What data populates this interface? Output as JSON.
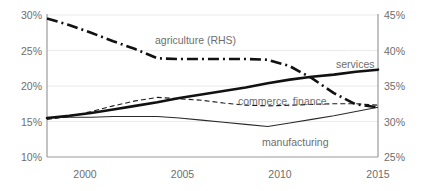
{
  "chart_data": {
    "type": "line",
    "title": "",
    "subtitle": "",
    "xlabel": "",
    "ylabel": "",
    "y2label": "",
    "grid": true,
    "legend_position": "inline-labels",
    "x": [
      2000,
      2001,
      2002,
      2003,
      2004,
      2005,
      2006,
      2007,
      2008,
      2009,
      2010,
      2011,
      2012,
      2013,
      2014,
      2015
    ],
    "xlim": [
      2000,
      2015
    ],
    "xticks": [
      "2000",
      "2005",
      "2010",
      "2015"
    ],
    "xtick_values": [
      2000,
      2005,
      2010,
      2015
    ],
    "ylim": [
      10,
      30
    ],
    "yticks": [
      "10%",
      "15%",
      "20%",
      "25%",
      "30%"
    ],
    "ytick_values": [
      10,
      15,
      20,
      25,
      30
    ],
    "y2lim": [
      25,
      45
    ],
    "y2ticks": [
      "25%",
      "30%",
      "35%",
      "40%",
      "45%"
    ],
    "y2tick_values": [
      25,
      30,
      35,
      40,
      45
    ],
    "series": [
      {
        "name": "services",
        "label": "services",
        "axis": "left",
        "style": "solid-thick",
        "color": "#111111",
        "values": [
          15.5,
          15.8,
          16.2,
          16.7,
          17.2,
          17.7,
          18.3,
          18.8,
          19.3,
          19.8,
          20.4,
          20.9,
          21.3,
          21.6,
          22.0,
          22.3
        ]
      },
      {
        "name": "commerce, finance",
        "label": "commerce, finance",
        "axis": "left",
        "style": "dashed-thin",
        "color": "#1a1a1a",
        "values": [
          15.3,
          15.7,
          16.4,
          17.2,
          17.9,
          18.4,
          18.2,
          18.0,
          17.6,
          17.3,
          17.2,
          17.3,
          17.4,
          17.5,
          17.5,
          17.3
        ]
      },
      {
        "name": "manufacturing",
        "label": "manufacturing",
        "axis": "left",
        "style": "solid-thin",
        "color": "#2a2a2a",
        "values": [
          15.5,
          15.6,
          15.6,
          15.7,
          15.7,
          15.7,
          15.5,
          15.2,
          14.9,
          14.6,
          14.3,
          14.8,
          15.3,
          15.8,
          16.4,
          17.0
        ]
      },
      {
        "name": "agriculture (RHS)",
        "label": "agriculture (RHS)",
        "axis": "right",
        "style": "dash-dot-thick",
        "color": "#111111",
        "values": [
          44.5,
          43.6,
          42.5,
          41.3,
          40.2,
          38.9,
          38.8,
          38.8,
          38.8,
          38.8,
          38.7,
          37.8,
          36.1,
          34.0,
          32.4,
          32.0
        ]
      }
    ],
    "annotations": [
      {
        "text": "agriculture (RHS)",
        "x": 2003.9,
        "y_axis": "right",
        "y": 41.2
      },
      {
        "text": "services",
        "x": 2013.6,
        "y_axis": "left",
        "y": 23.2
      },
      {
        "text": "commerce, finance",
        "x": 2010.4,
        "y_axis": "left",
        "y": 18.6
      },
      {
        "text": "manufacturing",
        "x": 2010.2,
        "y_axis": "left",
        "y": 13.1
      }
    ]
  },
  "axes": {
    "left": {
      "ticks": [
        {
          "label": "30%"
        },
        {
          "label": "25%"
        },
        {
          "label": "20%"
        },
        {
          "label": "15%"
        },
        {
          "label": "10%"
        }
      ]
    },
    "right": {
      "ticks": [
        {
          "label": "45%"
        },
        {
          "label": "40%"
        },
        {
          "label": "35%"
        },
        {
          "label": "30%"
        },
        {
          "label": "25%"
        }
      ]
    },
    "bottom": {
      "ticks": [
        {
          "label": "2000"
        },
        {
          "label": "2005"
        },
        {
          "label": "2010"
        },
        {
          "label": "2015"
        }
      ]
    }
  },
  "labels": {
    "agriculture": "agriculture (RHS)",
    "services": "services",
    "commerce": "commerce, finance",
    "manufacturing": "manufacturing"
  },
  "colors": {
    "background": "#ffffff",
    "gridline": "#eceaea",
    "axis": "#9a9a9a",
    "tick_text": "#6e6e6e",
    "label_text": "#6e6e6e",
    "series_dark": "#111111"
  }
}
